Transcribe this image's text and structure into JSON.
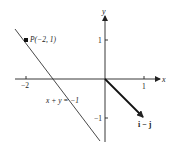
{
  "diagram": {
    "axes": {
      "x_label": "x",
      "y_label": "y",
      "x_ticks": [
        {
          "value": -2,
          "label": "−2"
        },
        {
          "value": 1,
          "label": "1"
        }
      ],
      "y_ticks": [
        {
          "value": 1,
          "label": "1"
        },
        {
          "value": -1,
          "label": "−1"
        }
      ]
    },
    "line": {
      "equation": "x + y = −1"
    },
    "point": {
      "label": "P(−2, 1)",
      "x": -2,
      "y": 1
    },
    "vector": {
      "label": "i − j",
      "from": [
        0,
        0
      ],
      "to": [
        1,
        -1
      ]
    },
    "colors": {
      "ink": "#222222",
      "background": "#ffffff"
    }
  }
}
